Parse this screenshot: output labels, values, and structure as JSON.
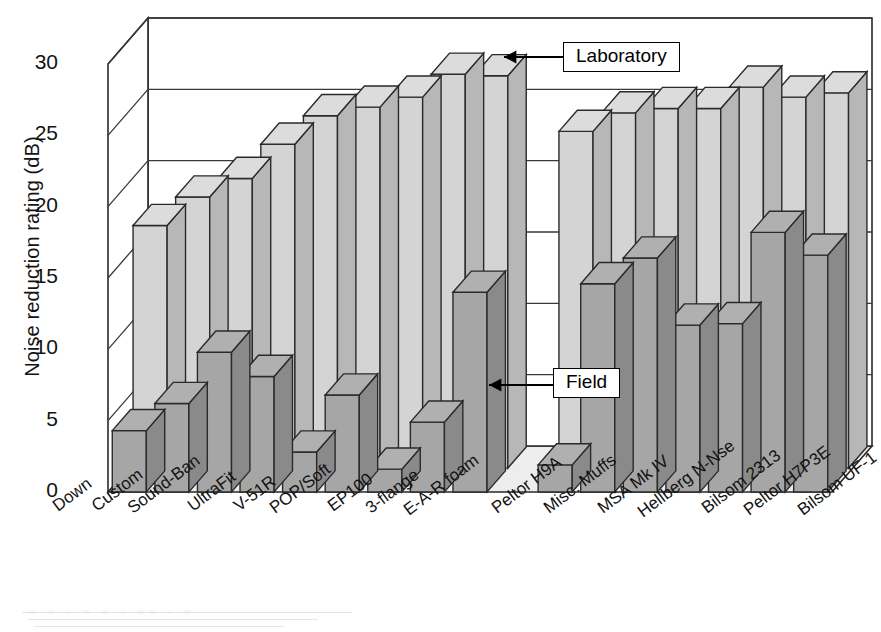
{
  "figure": {
    "ylabel": "Noise reduction rating (dB)",
    "yticks": [
      0,
      5,
      10,
      15,
      20,
      25,
      30
    ],
    "callouts": {
      "laboratory": "Laboratory",
      "field": "Field"
    }
  },
  "chart_data": {
    "type": "bar",
    "title": "",
    "xlabel": "",
    "ylabel": "Noise reduction rating (dB)",
    "ylim": [
      0,
      30
    ],
    "yticks": [
      0,
      5,
      10,
      15,
      20,
      25,
      30
    ],
    "grid": true,
    "legend_position": "annotated-callouts",
    "style": "3d-two-row",
    "annotations": [
      "Laboratory",
      "Field"
    ],
    "categories": [
      "Down",
      "Custom",
      "Sound-Ban",
      "UltraFit",
      "V-51R",
      "POP/Soft",
      "EP100",
      "3-flange",
      "E-A-R foam",
      "",
      "Peltor H9A",
      "Misc. Muffs",
      "MSA Mk IV",
      "Hellberg N-Nse",
      "Bilsom 2313",
      "Peltor H7P3E",
      "Bilsom UF-1"
    ],
    "series": [
      {
        "name": "Laboratory",
        "color": "#d2d2d2",
        "values": [
          17.0,
          19.0,
          20.3,
          22.7,
          24.7,
          25.3,
          26.0,
          27.6,
          27.5,
          null,
          23.6,
          24.9,
          25.2,
          25.2,
          26.7,
          26.0,
          26.3
        ]
      },
      {
        "name": "Field",
        "color": "#a2a2a2",
        "values": [
          4.3,
          6.2,
          9.8,
          8.1,
          2.8,
          6.8,
          1.6,
          4.9,
          14.0,
          null,
          1.9,
          14.6,
          16.4,
          11.7,
          11.8,
          18.2,
          16.6
        ]
      }
    ]
  },
  "xlabels": [
    {
      "text": "Down",
      "x": 55,
      "y": 498
    },
    {
      "text": "Custom",
      "x": 94,
      "y": 498
    },
    {
      "text": "Sound-Ban",
      "x": 130,
      "y": 500
    },
    {
      "text": "UltraFit",
      "x": 190,
      "y": 498
    },
    {
      "text": "V-51R",
      "x": 236,
      "y": 498
    },
    {
      "text": "POP/Soft",
      "x": 272,
      "y": 500
    },
    {
      "text": "EP100",
      "x": 330,
      "y": 498
    },
    {
      "text": "3-flange",
      "x": 368,
      "y": 500
    },
    {
      "text": "E-A-R foam",
      "x": 406,
      "y": 502
    },
    {
      "text": "Peltor H9A",
      "x": 494,
      "y": 500
    },
    {
      "text": "Misc. Muffs",
      "x": 546,
      "y": 500
    },
    {
      "text": "MSA Mk IV",
      "x": 600,
      "y": 500
    },
    {
      "text": "Hellberg N-Nse",
      "x": 640,
      "y": 504
    },
    {
      "text": "Bilsom 2313",
      "x": 704,
      "y": 500
    },
    {
      "text": "Peltor H7P3E",
      "x": 746,
      "y": 502
    },
    {
      "text": "Bilsom UF-1",
      "x": 800,
      "y": 502
    }
  ]
}
